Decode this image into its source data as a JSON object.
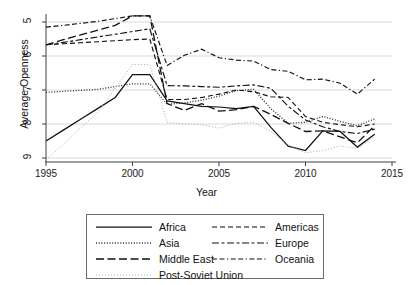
{
  "chart_data": {
    "type": "line",
    "title": "",
    "xlabel": "Year",
    "ylabel": "Average Openness",
    "xlim": [
      1995,
      2015
    ],
    "ylim": [
      5,
      9
    ],
    "xticks": [
      1995,
      2000,
      2005,
      2010,
      2015
    ],
    "yticks": [
      5,
      6,
      7,
      8,
      9
    ],
    "grid": "horizontal",
    "legend_position": "bottom",
    "x": [
      1995,
      1996,
      1997,
      1998,
      1999,
      2000,
      2001,
      2002,
      2003,
      2004,
      2005,
      2006,
      2007,
      2008,
      2009,
      2010,
      2011,
      2012,
      2013,
      2014
    ],
    "series": [
      {
        "name": "Africa",
        "style": "solid",
        "values": [
          5.5,
          5.82,
          6.14,
          6.46,
          6.78,
          7.45,
          7.45,
          6.68,
          6.6,
          6.52,
          6.5,
          6.45,
          6.52,
          5.9,
          5.35,
          5.22,
          5.8,
          5.78,
          5.32,
          5.7
        ]
      },
      {
        "name": "Americas",
        "style": "dashed",
        "values": [
          8.33,
          8.36,
          8.39,
          8.42,
          8.45,
          8.48,
          8.5,
          6.72,
          6.72,
          6.78,
          6.88,
          7.0,
          6.95,
          6.8,
          6.78,
          6.22,
          6.05,
          5.98,
          5.92,
          6.0
        ]
      },
      {
        "name": "Asia",
        "style": "dotted",
        "values": [
          6.93,
          6.96,
          6.99,
          7.02,
          7.1,
          7.18,
          7.18,
          6.58,
          6.62,
          6.7,
          6.82,
          6.98,
          7.02,
          6.45,
          6.02,
          6.05,
          6.22,
          6.08,
          5.95,
          6.15
        ]
      },
      {
        "name": "Europe",
        "style": "dash-dot",
        "values": [
          8.33,
          8.4,
          8.48,
          8.56,
          8.64,
          8.72,
          8.8,
          7.13,
          7.12,
          7.1,
          7.08,
          7.12,
          7.15,
          7.05,
          6.52,
          6.12,
          5.92,
          5.78,
          5.72,
          5.85
        ]
      },
      {
        "name": "Middle East",
        "style": "long-dash",
        "values": [
          8.33,
          8.48,
          8.62,
          8.76,
          8.9,
          9.18,
          9.18,
          6.6,
          6.4,
          6.6,
          6.38,
          6.42,
          6.52,
          6.28,
          6.02,
          5.78,
          5.8,
          5.62,
          5.45,
          5.95
        ]
      },
      {
        "name": "Oceania",
        "style": "dash-dash-dot",
        "values": [
          8.85,
          8.9,
          8.96,
          9.02,
          9.1,
          9.18,
          9.18,
          7.72,
          8.02,
          8.2,
          7.95,
          7.88,
          7.85,
          7.6,
          7.55,
          7.3,
          7.32,
          7.2,
          6.88,
          7.32
        ]
      },
      {
        "name": "Post-Soviet Union",
        "style": "fine-dotted",
        "values": [
          4.95,
          5.4,
          5.88,
          6.35,
          7.05,
          7.75,
          7.75,
          6.05,
          6.0,
          5.98,
          5.88,
          6.02,
          6.05,
          5.78,
          5.38,
          5.15,
          5.22,
          5.35,
          5.28,
          5.62
        ]
      }
    ]
  },
  "axis": {
    "y_tick_labels": [
      "9",
      "8",
      "7",
      "6",
      "5"
    ],
    "x_tick_labels": [
      "1995",
      "2000",
      "2005",
      "2010",
      "2015"
    ],
    "y_title": "Average Openness",
    "x_title": "Year"
  },
  "legend": {
    "rows": [
      {
        "left": {
          "name": "Africa",
          "style": "solid"
        },
        "right": {
          "name": "Americas",
          "style": "dashed"
        }
      },
      {
        "left": {
          "name": "Asia",
          "style": "dotted"
        },
        "right": {
          "name": "Europe",
          "style": "dash-dot"
        }
      },
      {
        "left": {
          "name": "Middle East",
          "style": "long-dash"
        },
        "right": {
          "name": "Oceania",
          "style": "dash-dash-dot"
        }
      }
    ],
    "full_row": {
      "name": "Post-Soviet Union",
      "style": "fine-dotted"
    }
  }
}
